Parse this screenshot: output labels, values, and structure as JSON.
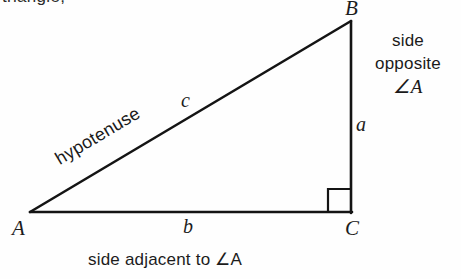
{
  "figure": {
    "caption_fragment": "triangle,",
    "type": "right-triangle-diagram",
    "stroke_color": "#141414",
    "background_color": "#fefefe",
    "vertices": {
      "A": {
        "label": "A",
        "x": 30,
        "y": 212
      },
      "B": {
        "label": "B",
        "x": 351,
        "y": 21
      },
      "C": {
        "label": "C",
        "x": 351,
        "y": 212
      }
    },
    "sides": {
      "a": {
        "label": "a",
        "from": "B",
        "to": "C",
        "description": "side opposite ∠A"
      },
      "b": {
        "label": "b",
        "from": "A",
        "to": "C",
        "description": "side adjacent to ∠A"
      },
      "c": {
        "label": "c",
        "from": "A",
        "to": "B",
        "description": "hypotenuse"
      }
    },
    "right_angle_at": "C",
    "labels": {
      "hypotenuse": "hypotenuse",
      "side_opposite_line1": "side",
      "side_opposite_line2": "opposite",
      "side_opposite_line3": "∠A",
      "side_adjacent": "side adjacent to ∠A"
    }
  }
}
